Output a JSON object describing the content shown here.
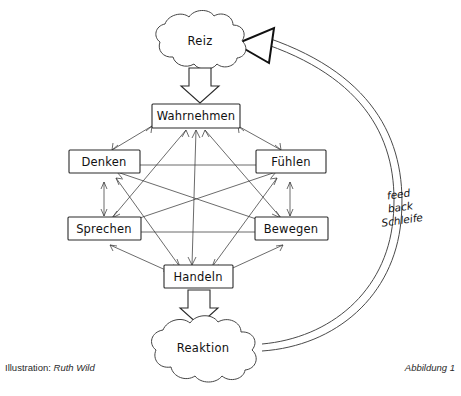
{
  "figure": {
    "credit_prefix": "Illustration:",
    "credit_name": "Ruth Wild",
    "caption": "Abbildung 1"
  },
  "clouds": [
    {
      "id": "reiz",
      "label": "Reiz"
    },
    {
      "id": "reaktion",
      "label": "Reaktion"
    }
  ],
  "nodes": [
    {
      "id": "wahrnehmen",
      "label": "Wahrnehmen"
    },
    {
      "id": "denken",
      "label": "Denken"
    },
    {
      "id": "fuehlen",
      "label": "Fühlen"
    },
    {
      "id": "sprechen",
      "label": "Sprechen"
    },
    {
      "id": "bewegen",
      "label": "Bewegen"
    },
    {
      "id": "handeln",
      "label": "Handeln"
    }
  ],
  "feedback_loop": {
    "line1": "feed",
    "line2": "back",
    "line3": "Schleife"
  },
  "colors": {
    "ink": "#2b2b2b",
    "paper": "#ffffff",
    "line": "#3a3a3a"
  }
}
